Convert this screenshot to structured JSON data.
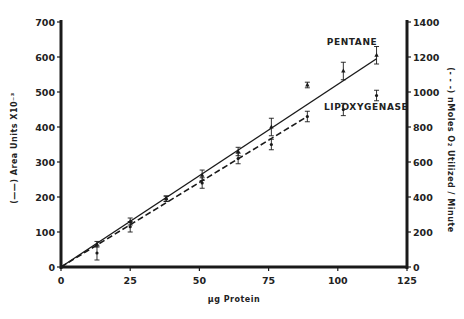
{
  "chart_data": {
    "type": "line",
    "title": "",
    "xlabel": "µg Protein",
    "ylabel_left": "(——) Area Units X10⁻³",
    "ylabel_right": "(- - -) nMoles O₂ Utilized / Minute",
    "xlim": [
      0,
      125
    ],
    "ylim_left": [
      0,
      700
    ],
    "ylim_right": [
      0,
      1400
    ],
    "x_ticks": [
      "0",
      "25",
      "50",
      "75",
      "100",
      "125"
    ],
    "y_ticks_left": [
      "0",
      "100",
      "200",
      "300",
      "400",
      "500",
      "600",
      "700"
    ],
    "y_ticks_right": [
      "0",
      "200",
      "400",
      "600",
      "800",
      "1000",
      "1200",
      "1400"
    ],
    "grid": false,
    "series": [
      {
        "name": "PENTANE",
        "axis": "left",
        "line_style": "solid",
        "marker": "triangle",
        "x": [
          13,
          25,
          38,
          51,
          64,
          76,
          89,
          102,
          114
        ],
        "y": [
          65,
          130,
          195,
          262,
          330,
          400,
          520,
          560,
          605
        ],
        "err": [
          8,
          10,
          8,
          15,
          12,
          25,
          8,
          25,
          25
        ],
        "fit_line": {
          "x": [
            0,
            114
          ],
          "y": [
            0,
            595
          ]
        }
      },
      {
        "name": "LIPOXYGENASE",
        "axis": "right",
        "line_style": "dashed",
        "marker": "circle",
        "x": [
          13,
          25,
          38,
          51,
          64,
          76,
          89,
          102,
          114
        ],
        "y": [
          80,
          230,
          390,
          480,
          620,
          700,
          860,
          900,
          980
        ],
        "err": [
          40,
          30,
          15,
          30,
          30,
          30,
          30,
          35,
          30
        ],
        "fit_line": {
          "x": [
            0,
            89
          ],
          "y": [
            0,
            860
          ]
        }
      }
    ],
    "annotations": [
      {
        "text": "PENTANE",
        "x": 96,
        "y": 635
      },
      {
        "text": "LIPOXYGENASE",
        "x": 95,
        "y": 450
      }
    ]
  }
}
